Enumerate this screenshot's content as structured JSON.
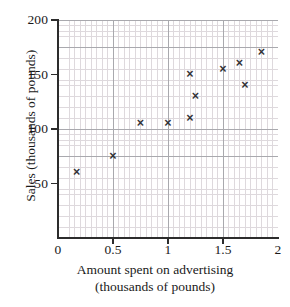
{
  "chart_data": {
    "type": "scatter",
    "title": "",
    "xlabel": "Amount spent on advertising (thousands of pounds)",
    "xlabel_lines": [
      "Amount spent on advertising",
      "(thousands of pounds)"
    ],
    "ylabel": "Sales (thousands of pounds)",
    "xlim": [
      0,
      2
    ],
    "ylim": [
      0,
      200
    ],
    "grid": true,
    "grid_major_x_step": 0.25,
    "grid_major_y_step": 25,
    "grid_minor_x_step": 0.05,
    "grid_minor_y_step": 5,
    "legend": "none",
    "marker": "x",
    "marker_color": "#333337",
    "xticks": [
      {
        "value": 0,
        "label": "0"
      },
      {
        "value": 0.5,
        "label": "0.5"
      },
      {
        "value": 1,
        "label": "1"
      },
      {
        "value": 1.5,
        "label": "1.5"
      },
      {
        "value": 2,
        "label": "2"
      }
    ],
    "yticks": [
      {
        "value": 50,
        "label": "50"
      },
      {
        "value": 100,
        "label": "100"
      },
      {
        "value": 150,
        "label": "150"
      },
      {
        "value": 200,
        "label": "200"
      }
    ],
    "points": [
      {
        "x": 0.17,
        "y": 60
      },
      {
        "x": 0.5,
        "y": 75
      },
      {
        "x": 0.75,
        "y": 105
      },
      {
        "x": 1.0,
        "y": 105
      },
      {
        "x": 1.2,
        "y": 110
      },
      {
        "x": 1.2,
        "y": 150
      },
      {
        "x": 1.25,
        "y": 130
      },
      {
        "x": 1.5,
        "y": 155
      },
      {
        "x": 1.65,
        "y": 160
      },
      {
        "x": 1.7,
        "y": 140
      },
      {
        "x": 1.85,
        "y": 170
      }
    ],
    "marker_glyph": "×"
  }
}
